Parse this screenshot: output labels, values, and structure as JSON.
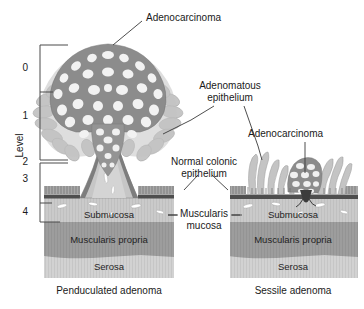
{
  "figure": {
    "title_alt": "Colonic adenoma morphology diagram",
    "width": 364,
    "height": 309,
    "background": "#ffffff"
  },
  "axis": {
    "title": "Level",
    "ticks": [
      "0",
      "1",
      "2",
      "3",
      "4"
    ],
    "tick_values": [
      0,
      1,
      2,
      3,
      4
    ],
    "bracket_upper_label_span": [
      "0",
      "2"
    ],
    "bracket_lower_label_span": [
      "2",
      "4"
    ],
    "line_color": "#4a4a4a"
  },
  "callouts": {
    "adenocarcinoma_top": "Adenocarcinoma",
    "adenomatous_epithelium": "Adenomatous\nepithelium",
    "adenocarcinoma_right": "Adenocarcinoma",
    "normal_colonic_epithelium": "Normal colonic\nepithelium",
    "muscularis_mucosa": "Muscularis\nmucosa"
  },
  "layers": {
    "left": {
      "submucosa": "Submucosa",
      "muscularis_propria": "Muscularis propria",
      "serosa": "Serosa"
    },
    "right": {
      "submucosa": "Submucosa",
      "muscularis_propria": "Muscularis propria",
      "serosa": "Serosa"
    }
  },
  "captions": {
    "left": "Penduculated adenoma",
    "right": "Sessile adenoma"
  },
  "colors": {
    "submucosa": "#c9c9c9",
    "muscularis_propria": "#9d9d9d",
    "serosa": "#cfcfcf",
    "muscularis_mucosa_band": "#555555",
    "mucosa_surface": "#8c8c8c",
    "adenoma_dark": "#8e8e8e",
    "adenoma_light": "#c4c4c4",
    "stalk": "#bdbdbd",
    "outline": "#6b6b6b",
    "text": "#1a1a1a",
    "leader_line": "#3a3a3a"
  }
}
